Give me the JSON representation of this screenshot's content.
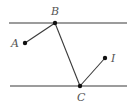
{
  "diagram": {
    "type": "geometry",
    "colors": {
      "line": "#3a3a3a",
      "point": "#111111",
      "label": "#555555"
    },
    "parallel_lines": [
      {
        "name": "top-line",
        "x1": 9,
        "y1": 23,
        "x2": 127,
        "y2": 23
      },
      {
        "name": "bottom-line",
        "x1": 10,
        "y1": 86,
        "x2": 127,
        "y2": 86
      }
    ],
    "points": {
      "A": {
        "label": "A",
        "x": 25,
        "y": 43,
        "label_x": 11,
        "label_y": 47
      },
      "B": {
        "label": "B",
        "x": 55,
        "y": 23,
        "label_x": 51,
        "label_y": 15
      },
      "C": {
        "label": "C",
        "x": 80,
        "y": 86,
        "label_x": 77,
        "label_y": 101
      },
      "I": {
        "label": "I",
        "x": 105,
        "y": 58,
        "label_x": 111,
        "label_y": 62
      }
    },
    "segments": [
      {
        "from": "A",
        "to": "B"
      },
      {
        "from": "B",
        "to": "C"
      },
      {
        "from": "C",
        "to": "I"
      }
    ]
  }
}
